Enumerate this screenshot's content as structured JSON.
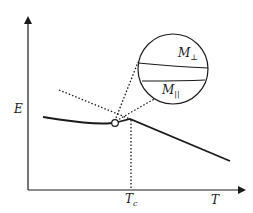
{
  "diagram": {
    "y_axis_label": "E",
    "x_axis_label": "T",
    "critical_label_main": "T",
    "critical_label_sub": "c",
    "inset": {
      "upper_label_main": "M",
      "upper_label_sub": "⊥",
      "lower_label_main": "M",
      "lower_label_sub": "||"
    },
    "colors": {
      "line": "#1a1a1a",
      "background": "#ffffff"
    }
  }
}
